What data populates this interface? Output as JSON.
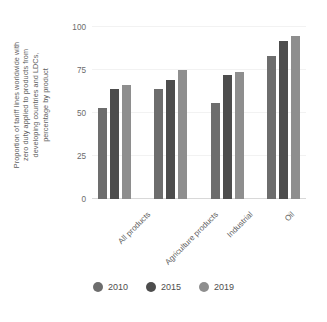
{
  "chart_data": {
    "type": "bar",
    "title": "",
    "xlabel": "",
    "ylabel": "Proportion of tariff lines worldwide with zero duty applied to products from developing countries and LDCs, percentage by product",
    "ylabel_lines": [
      "Proportion of tariff lines worldwide with",
      "zero duty applied to products from",
      "developing countries and LDCs,",
      "percentage by product"
    ],
    "categories": [
      "All products",
      "Agriculture products",
      "Industrial",
      "Oil"
    ],
    "series": [
      {
        "name": "2010",
        "color": "#6d6d6d",
        "values": [
          53,
          64,
          56,
          83
        ]
      },
      {
        "name": "2015",
        "color": "#4d4d4d",
        "values": [
          64,
          69,
          72,
          92
        ]
      },
      {
        "name": "2019",
        "color": "#8e8e8e",
        "values": [
          66,
          75,
          74,
          95
        ]
      }
    ],
    "ylim": [
      0,
      100
    ],
    "yticks": [
      0,
      25,
      50,
      75,
      100
    ],
    "ytick_labels": [
      "0",
      "25",
      "50",
      "75",
      "100"
    ],
    "grid": true,
    "legend_position": "bottom"
  },
  "legend": {
    "items": [
      {
        "label": "2010",
        "color": "#6d6d6d"
      },
      {
        "label": "2015",
        "color": "#4d4d4d"
      },
      {
        "label": "2019",
        "color": "#8e8e8e"
      }
    ]
  }
}
